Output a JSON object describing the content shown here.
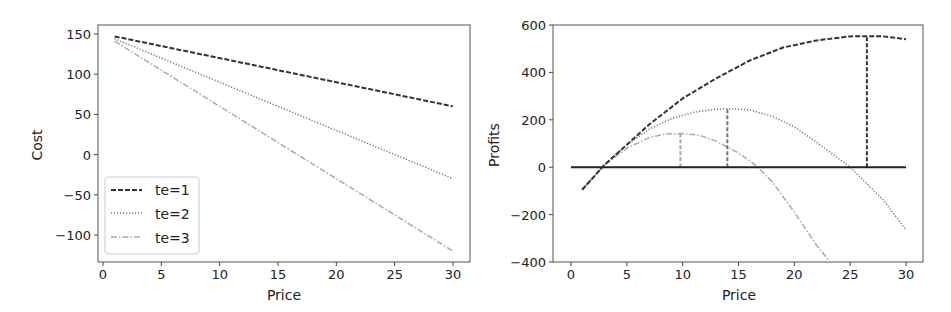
{
  "chart_data": [
    {
      "type": "line",
      "title": "",
      "xlabel": "Price",
      "ylabel": "Cost",
      "xlim": [
        -1,
        31.5
      ],
      "ylim": [
        -137,
        160
      ],
      "xticks": [
        0,
        5,
        10,
        15,
        20,
        25,
        30
      ],
      "yticks": [
        -100,
        -50,
        0,
        50,
        100,
        150
      ],
      "ytick_labels": [
        "−100",
        "−50",
        "0",
        "50",
        "100",
        "150"
      ],
      "grid": false,
      "legend_position": "lower left",
      "x": [
        1,
        30
      ],
      "series": [
        {
          "name": "te=1",
          "style": "dashed",
          "color": "#333333",
          "values": [
            147,
            60
          ]
        },
        {
          "name": "te=2",
          "style": "dotted",
          "color": "#777777",
          "values": [
            144,
            -30
          ]
        },
        {
          "name": "te=3",
          "style": "dashdot",
          "color": "#aaaaaa",
          "values": [
            141,
            -120
          ]
        }
      ]
    },
    {
      "type": "line",
      "title": "",
      "xlabel": "Price",
      "ylabel": "Profits",
      "xlim": [
        -1.5,
        31.5
      ],
      "ylim": [
        -400,
        600
      ],
      "xticks": [
        0,
        5,
        10,
        15,
        20,
        25,
        30
      ],
      "yticks": [
        -400,
        -200,
        0,
        200,
        400,
        600
      ],
      "ytick_labels": [
        "−400",
        "−200",
        "0",
        "200",
        "400",
        "600"
      ],
      "grid": false,
      "zero_line": {
        "x_from": 0,
        "x_to": 30,
        "y": 0,
        "color": "#222222"
      },
      "series": [
        {
          "name": "te=1",
          "style": "dashed",
          "color": "#333333",
          "x": [
            1,
            3,
            5,
            7,
            10,
            13,
            16,
            19,
            22,
            25,
            26.5,
            28,
            30
          ],
          "values": [
            -95,
            10,
            95,
            180,
            290,
            375,
            450,
            505,
            535,
            552,
            553,
            552,
            540
          ],
          "max_marker": {
            "x": 26.5,
            "y": 553
          }
        },
        {
          "name": "te=2",
          "style": "dotted",
          "color": "#777777",
          "x": [
            1,
            3,
            5,
            7,
            9,
            11,
            13,
            14,
            16,
            18,
            20,
            22,
            25,
            28,
            30
          ],
          "values": [
            -95,
            10,
            95,
            160,
            205,
            232,
            245,
            247,
            242,
            215,
            170,
            105,
            0,
            -140,
            -265
          ],
          "max_marker": {
            "x": 14,
            "y": 247
          }
        },
        {
          "name": "te=3",
          "style": "dashdot",
          "color": "#aaaaaa",
          "x": [
            1,
            3,
            5,
            7,
            8.5,
            10,
            11.5,
            13,
            15,
            16.5,
            18,
            20,
            22,
            23.2
          ],
          "values": [
            -95,
            10,
            80,
            125,
            140,
            142,
            135,
            110,
            60,
            10,
            -60,
            -190,
            -330,
            -400
          ],
          "max_marker": {
            "x": 9.8,
            "y": 142
          }
        }
      ]
    }
  ]
}
